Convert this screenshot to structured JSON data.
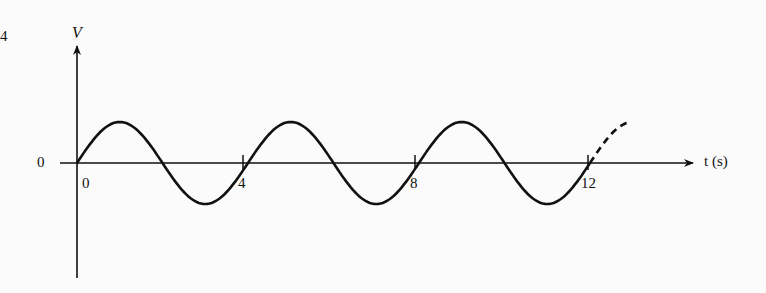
{
  "figure": {
    "corner_mark": "4",
    "y_axis_label": "V",
    "x_axis_label": "t (s)",
    "y_zero_label": "0"
  },
  "chart_data": {
    "type": "line",
    "title": "",
    "xlabel": "t (s)",
    "ylabel": "V",
    "x_ticks": [
      "0",
      "4",
      "8",
      "12"
    ],
    "y_ticks": [
      "0"
    ],
    "series": [
      {
        "name": "V(t) sinusoid, period 4 s",
        "style": "solid",
        "x": [
          0,
          1,
          2,
          3,
          4,
          5,
          6,
          7,
          8,
          9,
          10,
          11,
          12
        ],
        "values": [
          0,
          1,
          0,
          -1,
          0,
          1,
          0,
          -1,
          0,
          1,
          0,
          -1,
          0
        ]
      },
      {
        "name": "V(t) continuation",
        "style": "dashed",
        "x": [
          12,
          13
        ],
        "values": [
          0,
          1
        ]
      }
    ],
    "period": 4,
    "grid": false,
    "legend": "none"
  }
}
